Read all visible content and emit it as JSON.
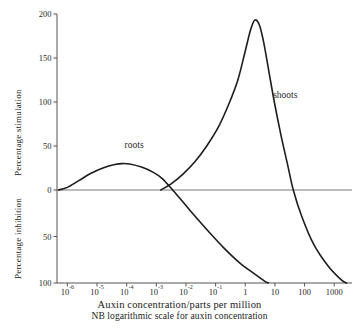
{
  "chart_data": {
    "type": "line",
    "title": "",
    "xlabel": "Auxin concentration/parts per million",
    "ylabel_upper": "Percentage stimulation",
    "ylabel_lower": "Percentage inhibition",
    "footnote": "NB logarithmic scale for auxin concentration",
    "x_scale": "log",
    "x_tick_labels": [
      "10-6",
      "10-5",
      "10-4",
      "10-3",
      "10-2",
      "10-1",
      "1",
      "10",
      "100",
      "1000"
    ],
    "x_tick_bases": [
      "10",
      "10",
      "10",
      "10",
      "10",
      "10",
      "1",
      "10",
      "100",
      "1000"
    ],
    "x_tick_exponents": [
      "-6",
      "-5",
      "-4",
      "-3",
      "-2",
      "-1",
      "",
      "",
      "",
      ""
    ],
    "x_tick_log_values": [
      -6,
      -5,
      -4,
      -3,
      -2,
      -1,
      0,
      1,
      2,
      3
    ],
    "xlim_log": [
      -6.35,
      3.6
    ],
    "y_tick_labels_upper": [
      "50",
      "100",
      "150",
      "200"
    ],
    "y_tick_values_upper": [
      50,
      100,
      150,
      200
    ],
    "y_tick_labels_lower": [
      "0",
      "50",
      "100"
    ],
    "y_tick_values_lower": [
      0,
      -50,
      -100
    ],
    "ylim": [
      -100,
      200
    ],
    "zero_line": 0,
    "grid": false,
    "legend": "inline-curve-labels",
    "series": [
      {
        "name": "roots",
        "label": "roots",
        "label_log_x": -3.75,
        "label_y": 48,
        "peak": {
          "log_x": -4.15,
          "value": 30
        },
        "zero_crossing_log_x": -2.45,
        "points": [
          {
            "log_x": -6.3,
            "y": 0
          },
          {
            "log_x": -6.0,
            "y": 3
          },
          {
            "log_x": -5.6,
            "y": 11
          },
          {
            "log_x": -5.2,
            "y": 19
          },
          {
            "log_x": -4.8,
            "y": 25
          },
          {
            "log_x": -4.4,
            "y": 29
          },
          {
            "log_x": -4.15,
            "y": 30
          },
          {
            "log_x": -3.9,
            "y": 29.5
          },
          {
            "log_x": -3.5,
            "y": 26
          },
          {
            "log_x": -3.1,
            "y": 20
          },
          {
            "log_x": -2.8,
            "y": 13
          },
          {
            "log_x": -2.45,
            "y": 0
          },
          {
            "log_x": -2.1,
            "y": -13
          },
          {
            "log_x": -1.7,
            "y": -28
          },
          {
            "log_x": -1.2,
            "y": -46
          },
          {
            "log_x": -0.7,
            "y": -63
          },
          {
            "log_x": -0.2,
            "y": -78
          },
          {
            "log_x": 0.3,
            "y": -90
          },
          {
            "log_x": 0.65,
            "y": -98
          },
          {
            "log_x": 0.78,
            "y": -100
          }
        ]
      },
      {
        "name": "shoots",
        "label": "shoots",
        "label_log_x": 1.35,
        "label_y": 104,
        "peak": {
          "log_x": 0.32,
          "value": 193
        },
        "zero_crossing_log_x": 1.62,
        "points": [
          {
            "log_x": -2.85,
            "y": 0
          },
          {
            "log_x": -2.5,
            "y": 7
          },
          {
            "log_x": -2.1,
            "y": 18
          },
          {
            "log_x": -1.7,
            "y": 32
          },
          {
            "log_x": -1.3,
            "y": 50
          },
          {
            "log_x": -0.9,
            "y": 72
          },
          {
            "log_x": -0.55,
            "y": 98
          },
          {
            "log_x": -0.25,
            "y": 125
          },
          {
            "log_x": 0.0,
            "y": 158
          },
          {
            "log_x": 0.18,
            "y": 182
          },
          {
            "log_x": 0.32,
            "y": 193
          },
          {
            "log_x": 0.47,
            "y": 188
          },
          {
            "log_x": 0.62,
            "y": 168
          },
          {
            "log_x": 0.8,
            "y": 134
          },
          {
            "log_x": 0.98,
            "y": 100
          },
          {
            "log_x": 1.2,
            "y": 63
          },
          {
            "log_x": 1.42,
            "y": 30
          },
          {
            "log_x": 1.62,
            "y": 0
          },
          {
            "log_x": 1.9,
            "y": -28
          },
          {
            "log_x": 2.3,
            "y": -58
          },
          {
            "log_x": 2.8,
            "y": -82
          },
          {
            "log_x": 3.25,
            "y": -97
          },
          {
            "log_x": 3.42,
            "y": -100
          }
        ]
      }
    ]
  }
}
